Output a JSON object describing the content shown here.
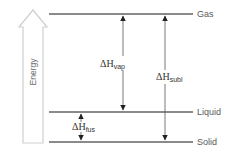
{
  "diagram": {
    "type": "energy-level-diagram",
    "axis": {
      "label": "Energy",
      "direction": "up"
    },
    "levels": [
      {
        "id": "gas",
        "label": "Gas",
        "y": 14
      },
      {
        "id": "liquid",
        "label": "Liquid",
        "y": 112
      },
      {
        "id": "solid",
        "label": "Solid",
        "y": 142
      }
    ],
    "transitions": [
      {
        "id": "vap",
        "symbol": "ΔH",
        "subscript": "vap",
        "from": "liquid",
        "to": "gas",
        "direction": "both"
      },
      {
        "id": "subl",
        "symbol": "ΔH",
        "subscript": "subl",
        "from": "solid",
        "to": "gas",
        "direction": "both"
      },
      {
        "id": "fus",
        "symbol": "ΔH",
        "subscript": "fus",
        "from": "solid",
        "to": "liquid",
        "direction": "both"
      }
    ],
    "colors": {
      "level_line": "#8a8a8a",
      "arrow": "#222222",
      "energy_arrow_outline": "#cfcfcf",
      "text": "#5a5a5a"
    }
  }
}
